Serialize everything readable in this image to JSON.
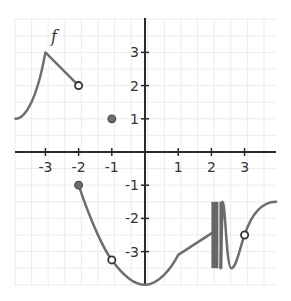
{
  "chart_data": {
    "type": "line",
    "title": "",
    "function_label": "f",
    "xlabel": "",
    "ylabel": "",
    "xlim": [
      -3.9,
      4.0
    ],
    "ylim": [
      -4.0,
      4.05
    ],
    "grid": true,
    "grid_step": 0.5,
    "x_ticks": [
      -3,
      -2,
      -1,
      1,
      2,
      3
    ],
    "x_tick_labels": [
      "-3",
      "-2",
      "-1",
      "1",
      "2",
      "3"
    ],
    "y_ticks": [
      3,
      2,
      1,
      -1,
      -2,
      -3
    ],
    "y_tick_labels": [
      "3",
      "2",
      "1",
      "-1",
      "-2",
      "-3"
    ],
    "series": [
      {
        "name": "f piece 1",
        "description": "increasing curve from (-3.9,1) up to peak (-3,3), then line down to open point (-2,2)",
        "points": [
          [
            -3.9,
            1.0
          ],
          [
            -3.6,
            1.3
          ],
          [
            -3.3,
            2.0
          ],
          [
            -3.0,
            3.0
          ],
          [
            -2.0,
            2.0
          ]
        ]
      },
      {
        "name": "f piece 2",
        "description": "from closed point (-2,-1) decreasing through open point (-1,-3.25) to minimum (0,-4), rising with corner at (1,-3.1), then to (2,-2.5); oscillating infinitely near x=2 (dense band between -1.5 and -3.5), one more oscillation, through open point (3,-2.5), leveling to (4,-1.5)",
        "points": [
          [
            -2.0,
            -1.0
          ],
          [
            -1.5,
            -2.3
          ],
          [
            -1.0,
            -3.25
          ],
          [
            -0.5,
            -3.8
          ],
          [
            0.0,
            -4.0
          ],
          [
            0.5,
            -3.75
          ],
          [
            1.0,
            -3.1
          ],
          [
            2.0,
            -2.5
          ],
          [
            2.35,
            -1.5
          ],
          [
            2.6,
            -3.5
          ],
          [
            3.0,
            -2.5
          ],
          [
            3.4,
            -1.7
          ],
          [
            4.0,
            -1.5
          ]
        ]
      }
    ],
    "markers": [
      {
        "x": -2,
        "y": 2,
        "style": "open"
      },
      {
        "x": -1,
        "y": 1,
        "style": "filled"
      },
      {
        "x": -2,
        "y": -1,
        "style": "filled"
      },
      {
        "x": -1,
        "y": -3.25,
        "style": "open"
      },
      {
        "x": 3,
        "y": -2.5,
        "style": "open"
      }
    ],
    "oscillation_band": {
      "x_range": [
        2.0,
        2.3
      ],
      "y_range": [
        -3.5,
        -1.5
      ]
    }
  }
}
